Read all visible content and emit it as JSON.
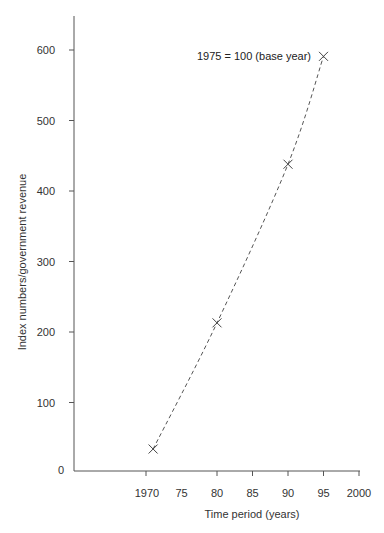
{
  "chart_data": {
    "type": "line",
    "title": "",
    "xlabel": "Time period (years)",
    "ylabel": "Index numbers/government revenue",
    "x_tick_labels": [
      "1970",
      "75",
      "80",
      "85",
      "90",
      "95",
      "2000"
    ],
    "x_tick_values": [
      1970,
      1975,
      1980,
      1985,
      1990,
      1995,
      2000
    ],
    "y_tick_labels": [
      "0",
      "100",
      "200",
      "300",
      "400",
      "500",
      "600"
    ],
    "y_tick_values": [
      0,
      100,
      200,
      300,
      400,
      500,
      600
    ],
    "xlim": [
      1960,
      2000
    ],
    "ylim": [
      0,
      650
    ],
    "grid": false,
    "legend": null,
    "annotations": [
      {
        "text": "1975 = 100 (base year)",
        "x": 1995,
        "y": 591
      }
    ],
    "series": [
      {
        "name": "Index numbers",
        "style": "dashed line with x markers",
        "x": [
          1971,
          1980,
          1990,
          1995
        ],
        "y": [
          34,
          213,
          438,
          591
        ]
      }
    ]
  }
}
